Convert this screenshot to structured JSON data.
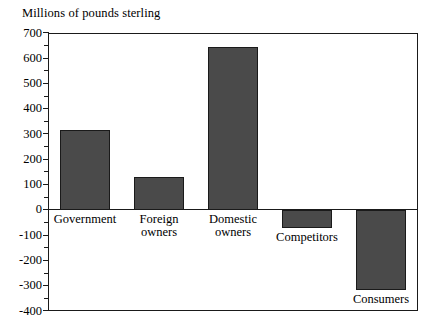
{
  "chart_data": {
    "type": "bar",
    "title": "Millions of pounds sterling",
    "subtitle": "",
    "xlabel": "",
    "ylabel": "Millions of pounds sterling",
    "categories": [
      "Government",
      "Foreign owners",
      "Domestic owners",
      "Competitors",
      "Consumers"
    ],
    "values": [
      315,
      130,
      645,
      -70,
      -315
    ],
    "ylim": [
      -400,
      700
    ],
    "ytick_labels": [
      "700",
      "600",
      "500",
      "400",
      "300",
      "200",
      "100",
      "0",
      "-100",
      "-200",
      "-300",
      "-400"
    ],
    "ytick_values": [
      700,
      600,
      500,
      400,
      300,
      200,
      100,
      0,
      -100,
      -200,
      -300,
      -400
    ],
    "minor_tick_step": 50,
    "grid": false,
    "legend": "none",
    "bar_color": "#4a4a4a",
    "bar_edge_color": "#1a1a1a",
    "frame_color": "#1a1a1a",
    "background_color": "#ffffff"
  },
  "labels": {
    "cat0_line1": "Government",
    "cat0_line2": "",
    "cat1_line1": "Foreign",
    "cat1_line2": "owners",
    "cat2_line1": "Domestic",
    "cat2_line2": "owners",
    "cat3_line1": "Competitors",
    "cat3_line2": "",
    "cat4_line1": "Consumers",
    "cat4_line2": ""
  }
}
